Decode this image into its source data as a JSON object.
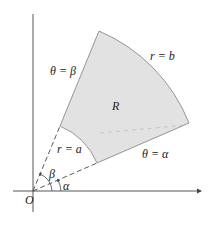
{
  "diagram": {
    "type": "polar-region",
    "colors": {
      "region_fill": "#e2e2e2",
      "region_stroke": "#8a8a8a",
      "axis": "#444444",
      "dashed": "#444444",
      "background": "#ffffff"
    },
    "labels": {
      "origin": "O",
      "region": "R",
      "outer_arc": "r = b",
      "inner_arc": "r = a",
      "upper_ray": "θ = β",
      "lower_ray": "θ = α",
      "angle_beta": "β",
      "angle_alpha": "α"
    }
  }
}
